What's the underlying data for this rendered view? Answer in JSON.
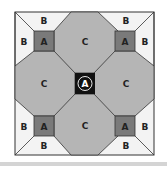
{
  "diagram": {
    "type": "quilt-block",
    "labels": {
      "center": "A",
      "corner_squares": [
        "A",
        "A",
        "A",
        "A"
      ],
      "octagons": [
        "C",
        "C",
        "C",
        "C"
      ],
      "triangles": [
        "B",
        "B",
        "B",
        "B",
        "B",
        "B",
        "B",
        "B"
      ]
    },
    "colors": {
      "background": "#ffffff",
      "light_triangle": "#f3f3f3",
      "octagon": "#b5b5b5",
      "small_square": "#7a7a7a",
      "center_square": "#111111",
      "outline": "#333333",
      "band": "#d4d4d4"
    }
  }
}
